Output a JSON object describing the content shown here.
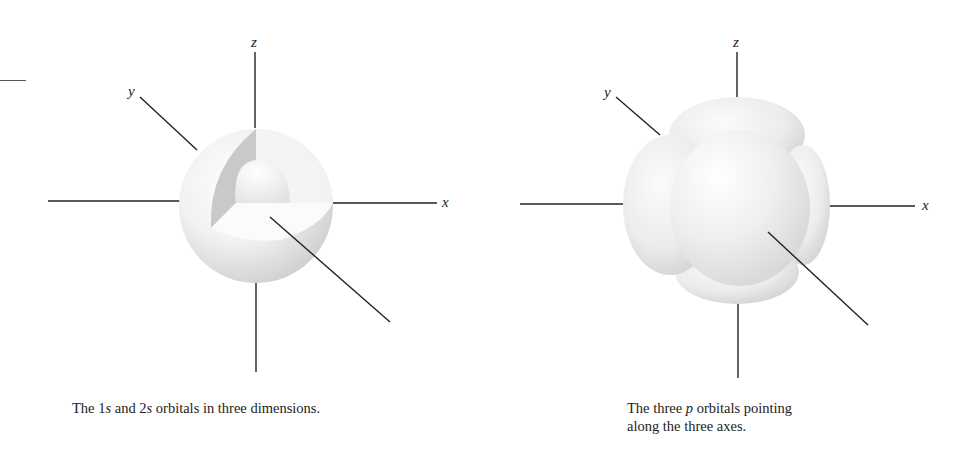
{
  "figures": [
    {
      "id": "s-orbitals",
      "axis_labels": {
        "x": "x",
        "y": "y",
        "z": "z"
      },
      "caption": {
        "pre": "The 1",
        "s1": "s",
        "mid": " and 2",
        "s2": "s",
        "post": " orbitals in three dimensions."
      }
    },
    {
      "id": "p-orbitals",
      "axis_labels": {
        "x": "x",
        "y": "y",
        "z": "z"
      },
      "caption": {
        "line1_pre": "The three ",
        "line1_p": "p",
        "line1_post": " orbitals pointing",
        "line2": "along the three axes."
      }
    }
  ]
}
